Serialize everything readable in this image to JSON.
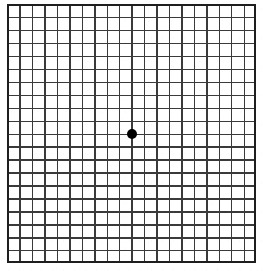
{
  "chart_data": {
    "type": "table",
    "grid": {
      "columns": 20,
      "rows": 20,
      "cell_width_px": 12.45,
      "cell_height_px": 12.95,
      "line_color": "#3a3a3a",
      "line_width_px": 1.4,
      "border_color": "#1e1e1e",
      "border_width_px": 2,
      "background_color": "#ffffff",
      "origin_x_px": 7,
      "origin_y_px": 4,
      "width_px": 249,
      "height_px": 259
    },
    "fixation_dot": {
      "label": "central fixation dot",
      "color": "#000000",
      "diameter_px": 10,
      "center_x_px": 131.5,
      "center_y_px": 133.5,
      "grid_column_index": 10,
      "grid_row_index": 10
    },
    "xlabel": "",
    "ylabel": "",
    "legend": [],
    "annotations": []
  },
  "canvas": {
    "width_px": 263,
    "height_px": 271,
    "background_color": "#ffffff"
  }
}
